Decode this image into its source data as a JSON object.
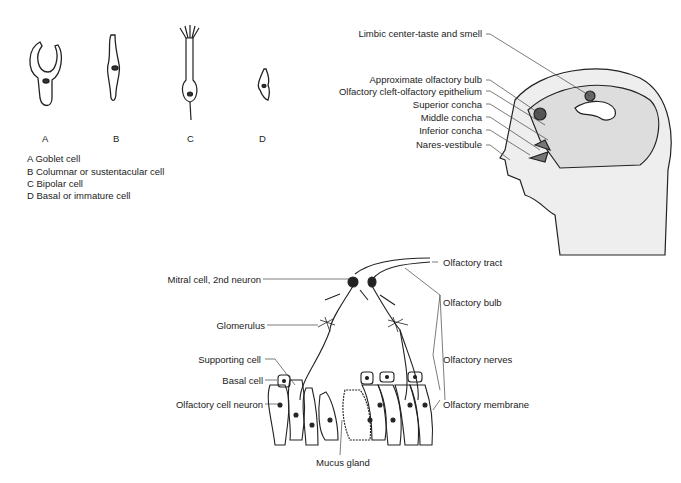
{
  "cells": {
    "letters": [
      "A",
      "B",
      "C",
      "D"
    ],
    "legend": [
      "A Goblet cell",
      "B Columnar or sustentacular cell",
      "C Bipolar cell",
      "D Basal or immature cell"
    ]
  },
  "head": {
    "labels": [
      "Limbic center-taste and smell",
      "Approximate olfactory bulb",
      "Olfactory cleft-olfactory epithelium",
      "Superior concha",
      "Middle concha",
      "Inferior concha",
      "Nares-vestibule"
    ]
  },
  "epithelium": {
    "left_labels": [
      "Mitral cell, 2nd neuron",
      "Glomerulus",
      "Supporting cell",
      "Basal cell",
      "Olfactory cell neuron"
    ],
    "right_labels": [
      "Olfactory tract",
      "Olfactory bulb",
      "Olfactory nerves",
      "Olfactory membrane"
    ],
    "bottom_label": "Mucus gland"
  }
}
